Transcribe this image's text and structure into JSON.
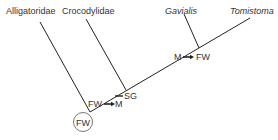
{
  "diagram": {
    "type": "phylogenetic-tree",
    "taxa": [
      {
        "name": "Alligatoridae",
        "italic": false
      },
      {
        "name": "Crocodylidae",
        "italic": false
      },
      {
        "name": "Gavialis",
        "italic": true
      },
      {
        "name": "Tomistoma",
        "italic": true
      }
    ],
    "annotations": {
      "root_state": "FW",
      "transition_1_from": "FW",
      "transition_1_to": "M",
      "node_label": "SG",
      "transition_2_from": "M",
      "transition_2_to": "FW"
    },
    "colors": {
      "line": "#222222",
      "text": "#333333",
      "background": "#ffffff"
    }
  }
}
